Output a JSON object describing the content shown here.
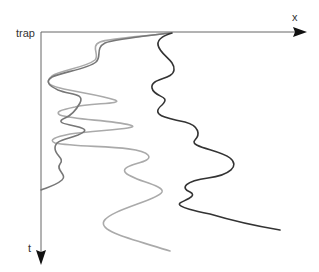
{
  "labels": {
    "origin": "trap",
    "x_axis": "x",
    "t_axis": "t"
  },
  "colors": {
    "axis": "#555555",
    "arrowhead": "#111111",
    "trajectory_dark": "#333333",
    "trajectory_medium": "#777777",
    "trajectory_light": "#aaaaaa"
  },
  "trajectories": [
    {
      "name": "dark",
      "description": "trajectory drifting right"
    },
    {
      "name": "medium",
      "description": "trajectory staying near trap"
    },
    {
      "name": "light",
      "description": "trajectory with large excursions"
    }
  ]
}
